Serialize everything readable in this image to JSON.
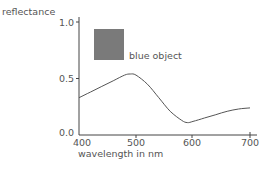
{
  "chart_data": {
    "type": "line",
    "title": "",
    "xlabel": "wavelength in nm",
    "ylabel": "reflectance",
    "xlim": [
      400,
      700
    ],
    "ylim": [
      0.0,
      1.0
    ],
    "x_ticks": [
      "400",
      "500",
      "600",
      "700"
    ],
    "y_ticks": [
      "0.0",
      "0.5",
      "1.0"
    ],
    "grid": false,
    "legend": {
      "position": "upper-left inside plot",
      "entries": [
        {
          "label": "blue object",
          "swatch_color": "#7a7a7a"
        }
      ]
    },
    "series": [
      {
        "name": "blue object",
        "color": "#555555",
        "x": [
          400,
          420,
          440,
          460,
          480,
          490,
          500,
          520,
          540,
          560,
          580,
          590,
          600,
          620,
          640,
          660,
          680,
          700
        ],
        "values": [
          0.33,
          0.38,
          0.43,
          0.48,
          0.53,
          0.54,
          0.53,
          0.45,
          0.33,
          0.21,
          0.13,
          0.11,
          0.12,
          0.15,
          0.18,
          0.21,
          0.23,
          0.24
        ]
      }
    ]
  }
}
